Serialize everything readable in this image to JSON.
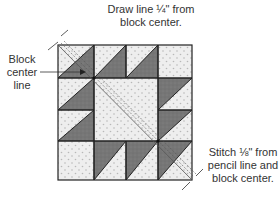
{
  "annotations": {
    "draw_line": "Draw line ¼\" from block center.",
    "draw_line_1": "Draw line ¼\" from",
    "draw_line_2": "block center.",
    "block_center_1": "Block",
    "block_center_2": "center",
    "block_center_3": "line",
    "stitch_1": "Stitch ⅛\" from",
    "stitch_2": "pencil line and",
    "stitch_3": "block center."
  },
  "block": {
    "grid": "4x4",
    "colors": {
      "light": "#ececec",
      "dark": "#7a7a7a",
      "outline": "#222222",
      "dots": "#b5b5b5"
    }
  }
}
